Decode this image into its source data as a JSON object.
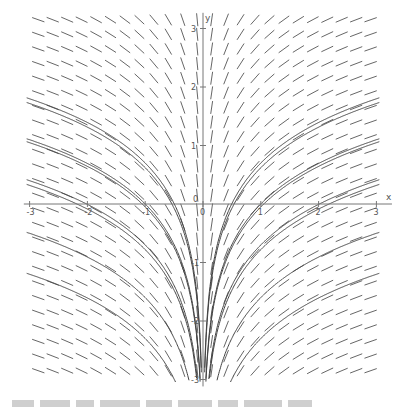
{
  "chart_data": {
    "type": "slope_field",
    "title": "",
    "equation_depicted": "dy/dx = 1/x",
    "solution_family": "y = ln|x| + C",
    "xlabel": "x",
    "ylabel": "y",
    "xlim": [
      -3.1,
      3.2
    ],
    "ylim": [
      -3.05,
      3.2
    ],
    "x_ticks": [
      -3,
      -2,
      -1,
      0,
      1,
      2,
      3
    ],
    "y_ticks": [
      -3,
      -2,
      -1,
      0,
      1,
      2,
      3
    ],
    "x_tick_labels": [
      "-3",
      "-2",
      "-1",
      "0",
      "1",
      "2",
      "3"
    ],
    "y_tick_labels": [
      "-3",
      "-2",
      "-1",
      "0",
      "1",
      "2",
      "3"
    ],
    "grid": false,
    "slope_grid": {
      "x_start": -2.85,
      "x_step": 0.25,
      "x_count": 24,
      "y_start": -2.85,
      "y_step": 0.25,
      "y_count": 25
    },
    "solution_curves_C": [
      0.7,
      0.62,
      0.0,
      -0.05,
      -0.7,
      -0.78,
      -1.6,
      -2.3
    ],
    "colors": {
      "segments": "#555555",
      "curves": "#444444",
      "axes": "#777777"
    }
  },
  "axes": {
    "x_name": "x",
    "y_name": "y",
    "origin_label_x": "0",
    "origin_label_y": "0"
  }
}
